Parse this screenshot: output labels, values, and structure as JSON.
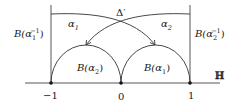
{
  "diagram": {
    "plane_label": "ℍ",
    "delta_label": "Δ′",
    "axis_ticks": [
      {
        "label": "−1",
        "x": 51
      },
      {
        "label": "0",
        "x": 121
      },
      {
        "label": "1",
        "x": 190
      }
    ],
    "arc_labels": {
      "alpha1": {
        "base": "α",
        "sub": "1"
      },
      "alpha2": {
        "base": "α",
        "sub": "2"
      }
    },
    "region_labels": {
      "left_vertical": {
        "prefix": "B(",
        "base": "α",
        "sub": "1",
        "sup": "−1",
        "suffix": ")"
      },
      "right_vertical": {
        "prefix": "B(",
        "base": "α",
        "sub": "2",
        "sup": "−1",
        "suffix": ")"
      },
      "left_semicircle": {
        "prefix": "B(",
        "base": "α",
        "sub": "2",
        "suffix": ")"
      },
      "right_semicircle": {
        "prefix": "B(",
        "base": "α",
        "sub": "1",
        "suffix": ")"
      }
    },
    "colors": {
      "stroke": "#333333",
      "text": "#1a1a1a",
      "background": "#ffffff"
    }
  }
}
